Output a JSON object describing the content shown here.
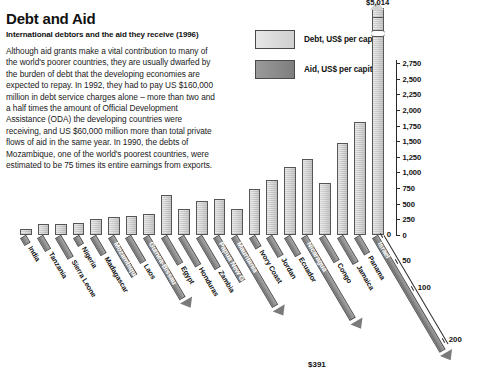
{
  "header": {
    "title": "Debt and Aid",
    "subtitle": "International debtors and the aid they receive (1996)",
    "body": "Although aid grants make a vital contribution to many of the world's poorer countries, they are usually dwarfed by the burden of debt that the developing economies are expected to repay. In 1992, they had to pay US $160,000 million in debt service charges alone – more than two and a half times the amount of Official Development Assistance (ODA) the developing countries were receiving, and US $60,000 million more than total private flows of aid in the same year. In 1990, the debts of Mozambique, one of the world's poorest countries, were estimated to be 75 times its entire earnings from exports."
  },
  "legend": {
    "items": [
      {
        "label": "Debt, US$ per capita",
        "swatch": "debt",
        "color": "#d8d8d8"
      },
      {
        "label": "Aid, US$ per capita",
        "swatch": "aid",
        "color": "#8c8c8c"
      }
    ]
  },
  "annotations": {
    "top_debt_value": "$5,014",
    "israel_aid_value": "$391"
  },
  "chart_data": {
    "type": "bar",
    "title": "Debt and Aid",
    "subtitle": "International debtors and the aid they receive (1996)",
    "xlabel": "",
    "ylabel": "US$ per capita",
    "grid": false,
    "legend_position": "top-right",
    "orientation": "vertical-with-diagonal-secondary-axis",
    "categories": [
      "India",
      "Tanzania",
      "Sierra Leone",
      "Nigeria",
      "Madagascar",
      "Mozambique",
      "Laos",
      "Guinea-Bissau",
      "Egypt",
      "Honduras",
      "Zambia",
      "Papua New Guinea",
      "Mauritania",
      "Ivory Coast",
      "Jordan",
      "Ecuador",
      "Nicaragua",
      "Congo",
      "Jamaica",
      "Panama",
      "Israel"
    ],
    "series": [
      {
        "name": "Debt, US$ per capita",
        "axis": "left-vertical",
        "units": "US$ per capita",
        "ylim": [
          0,
          2750
        ],
        "yticks": [
          0,
          250,
          500,
          750,
          1000,
          1250,
          1500,
          1750,
          2000,
          2250,
          2500,
          2750
        ],
        "ytick_labels": [
          "0",
          "250",
          "500",
          "750",
          "1,000",
          "1,250",
          "1,500",
          "1,750",
          "2,000",
          "2,250",
          "2,500",
          "2,750"
        ],
        "values": [
          100,
          170,
          180,
          190,
          250,
          290,
          310,
          330,
          640,
          420,
          540,
          580,
          420,
          730,
          880,
          1090,
          1220,
          830,
          1470,
          1800,
          5014
        ],
        "overflow_index": 20,
        "overflow_label": "$5,014"
      },
      {
        "name": "Aid, US$ per capita",
        "axis": "diagonal",
        "units": "US$ per capita",
        "ylim": [
          0,
          200
        ],
        "yticks": [
          0,
          50,
          100,
          200
        ],
        "ytick_labels": [
          "0",
          "50",
          "100",
          "200"
        ],
        "values": [
          2,
          13,
          28,
          3,
          22,
          62,
          36,
          105,
          40,
          42,
          48,
          72,
          120,
          9,
          24,
          23,
          145,
          34,
          38,
          20,
          391
        ],
        "overflow_index": 20,
        "overflow_label": "$391"
      }
    ]
  }
}
